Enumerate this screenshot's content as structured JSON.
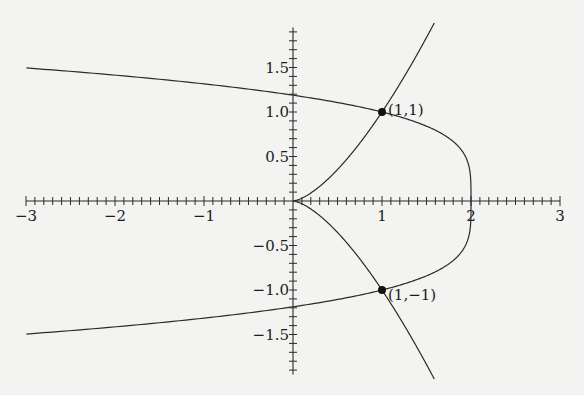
{
  "chart_data": {
    "type": "line",
    "title": "",
    "xlabel": "",
    "ylabel": "",
    "xlim": [
      -3,
      3
    ],
    "ylim": [
      -1.95,
      1.95
    ],
    "grid": false,
    "legend": null,
    "x_ticks": {
      "major": [
        -3,
        -2,
        -1,
        1,
        2,
        3
      ],
      "labels": [
        "−3",
        "−2",
        "−1",
        "1",
        "2",
        "3"
      ],
      "minor_step": 0.1
    },
    "y_ticks": {
      "major": [
        1.5,
        1.0,
        0.5,
        -0.5,
        -1.0,
        -1.5
      ],
      "labels": [
        "1.5",
        "1.0",
        "0.5",
        "−0.5",
        "−1.0",
        "−1.5"
      ],
      "minor_step": 0.1
    },
    "series": [
      {
        "name": "y^2 = x^3 (cuspidal cubic)",
        "description": "cusp at origin, passes through (1,1) and (1,-1)",
        "y_range": [
          -2.0,
          2.0
        ],
        "points": [
          [
            1.587,
            2.0
          ],
          [
            1.0,
            1.0
          ],
          [
            0.63,
            0.5
          ],
          [
            0,
            0
          ],
          [
            0.63,
            -0.5
          ],
          [
            1.0,
            -1.0
          ],
          [
            1.587,
            -2.0
          ]
        ]
      },
      {
        "name": "x = 2 - y^4",
        "description": "opens left, vertex at (2,0), passes through (1,1) and (1,-1)",
        "y_range": [
          -1.495,
          1.495
        ],
        "points": [
          [
            -3,
            1.495
          ],
          [
            -1,
            1.316
          ],
          [
            0,
            1.189
          ],
          [
            1,
            1.0
          ],
          [
            2,
            0
          ],
          [
            1,
            -1.0
          ],
          [
            0,
            -1.189
          ],
          [
            -1,
            -1.316
          ],
          [
            -3,
            -1.495
          ]
        ]
      }
    ],
    "annotations": [
      {
        "point": [
          1,
          1
        ],
        "label": "(1,1)"
      },
      {
        "point": [
          1,
          -1
        ],
        "label": "(1,−1)"
      }
    ]
  },
  "layout": {
    "origin_px": [
      293,
      201
    ],
    "scale_px": [
      89,
      89
    ]
  }
}
